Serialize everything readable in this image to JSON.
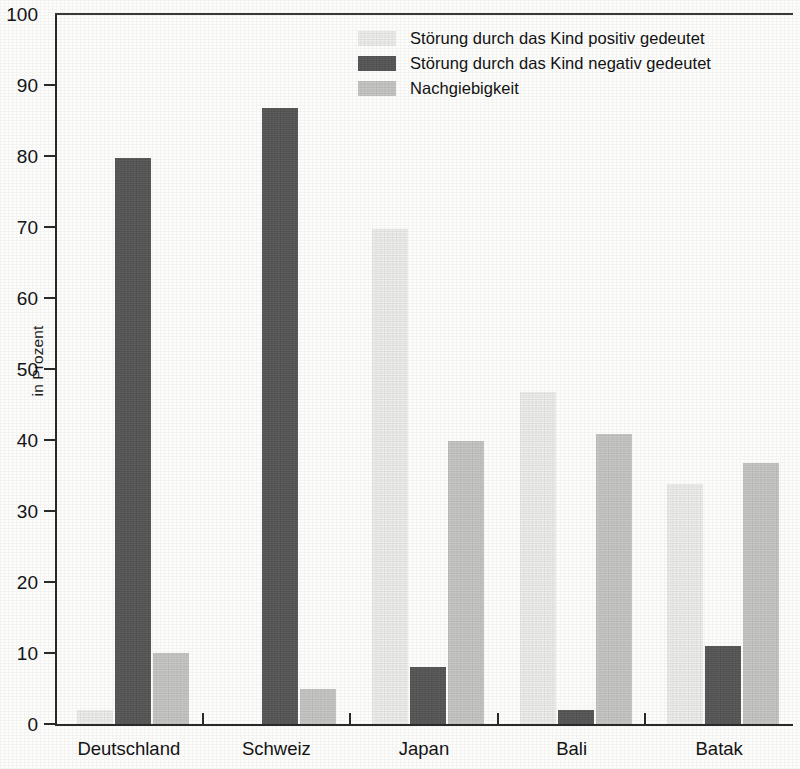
{
  "chart_data": {
    "type": "bar",
    "title": "",
    "xlabel": "",
    "ylabel": "in Prozent",
    "ylim": [
      0,
      100
    ],
    "ytick_step": 10,
    "ytick_labels": [
      "0",
      "10",
      "20",
      "30",
      "40",
      "50",
      "60",
      "70",
      "80",
      "90",
      "100"
    ],
    "grid": false,
    "legend_position": "top-center-right",
    "categories": [
      "Deutschland",
      "Schweiz",
      "Japan",
      "Bali",
      "Batak"
    ],
    "series": [
      {
        "name": "Störung durch das Kind positiv gedeutet",
        "color": "#eeeeec",
        "values": [
          2,
          0,
          69.7,
          46.8,
          33.8
        ]
      },
      {
        "name": "Störung durch das Kind negativ gedeutet",
        "color": "#565656",
        "values": [
          79.7,
          86.7,
          8,
          2,
          11
        ]
      },
      {
        "name": "Nachgiebigkeit",
        "color": "#c6c6c4",
        "values": [
          10,
          5,
          39.8,
          40.8,
          36.8
        ]
      }
    ]
  }
}
